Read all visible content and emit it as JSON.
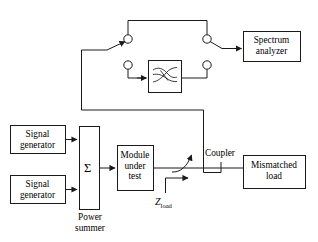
{
  "diagram": {
    "stroke_color": "#1a1a1a",
    "fill_color": "#ffffff",
    "background": "#ffffff",
    "blocks": [
      {
        "id": "signal-generator-1",
        "label_line1": "Signal",
        "label_line2": "generator",
        "x": 10,
        "y": 125,
        "w": 55,
        "h": 28
      },
      {
        "id": "signal-generator-2",
        "label_line1": "Signal",
        "label_line2": "generator",
        "x": 10,
        "y": 175,
        "w": 55,
        "h": 28
      },
      {
        "id": "power-summer",
        "label_line1": "",
        "label_line2": "",
        "x": 79,
        "y": 126,
        "w": 20,
        "h": 83
      },
      {
        "id": "module-under-test",
        "label_line1": "Module",
        "label_line2": "under",
        "label_line3": "test",
        "x": 117,
        "y": 145,
        "w": 36,
        "h": 45
      },
      {
        "id": "mismatched-load",
        "label_line1": "Mismatched",
        "label_line2": "load",
        "x": 243,
        "y": 155,
        "w": 62,
        "h": 33
      },
      {
        "id": "spectrum-analyzer",
        "label_line1": "Spectrum",
        "label_line2": "analyzer",
        "x": 243,
        "y": 31,
        "w": 57,
        "h": 30
      },
      {
        "id": "filter",
        "label_line1": "",
        "label_line2": "",
        "x": 148,
        "y": 60,
        "w": 33,
        "h": 32
      }
    ],
    "labels": {
      "signal_generator_1_line1": "Signal",
      "signal_generator_1_line2": "generator",
      "signal_generator_2_line1": "Signal",
      "signal_generator_2_line2": "generator",
      "power_summer_symbol": "Σ",
      "power_summer_line1": "Power",
      "power_summer_line2": "summer",
      "module_line1": "Module",
      "module_line2": "under",
      "module_line3": "test",
      "coupler": "Coupler",
      "mismatched_load_line1": "Mismatched",
      "mismatched_load_line2": "load",
      "spectrum_analyzer_line1": "Spectrum",
      "spectrum_analyzer_line2": "analyzer",
      "z_load_main": "Z",
      "z_load_sub": "load"
    },
    "switches": [
      {
        "id": "switch-upper-left",
        "cx": 128,
        "cy": 39,
        "r": 4.2
      },
      {
        "id": "switch-upper-right",
        "cx": 207,
        "cy": 39,
        "r": 4.2
      },
      {
        "id": "switch-lower-left",
        "cx": 128,
        "cy": 65,
        "r": 4.2
      },
      {
        "id": "switch-lower-right",
        "cx": 207,
        "cy": 65,
        "r": 4.2
      }
    ]
  }
}
